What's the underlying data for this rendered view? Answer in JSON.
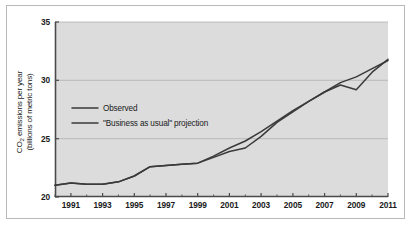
{
  "figure": {
    "frame_color": "#b9b9b9",
    "plot_bg_color": "#dcdcdc",
    "line_color": "#3a3a3a",
    "grid_color": "#b0b0b0",
    "axis_color": "#4a4a4a"
  },
  "axis": {
    "ylabel_line1_pre": "CO",
    "ylabel_line1_sub": "2",
    "ylabel_line1_post": " emissions per year",
    "ylabel_line2": "(billions of metric tons)",
    "yticks": [
      "20",
      "25",
      "30",
      "35"
    ],
    "xticks": [
      "1991",
      "1993",
      "1995",
      "1997",
      "1999",
      "2001",
      "2003",
      "2005",
      "2007",
      "2009",
      "2011"
    ]
  },
  "legend": {
    "items": [
      {
        "label": "Observed",
        "color": "#3a3a3a"
      },
      {
        "label": "\"Business as usual\" projection",
        "color": "#3a3a3a"
      }
    ]
  },
  "chart_data": {
    "type": "line",
    "title": "",
    "xlabel": "",
    "ylabel": "CO2 emissions per year (billions of metric tons)",
    "xlim": [
      1990,
      2011
    ],
    "ylim": [
      20,
      35
    ],
    "yticks": [
      20,
      25,
      30,
      35
    ],
    "xticks": [
      1991,
      1993,
      1995,
      1997,
      1999,
      2001,
      2003,
      2005,
      2007,
      2009,
      2011
    ],
    "minor_xticks_every": 1,
    "grid": "horizontal",
    "legend_position": "inside-upper-left",
    "x": [
      1990,
      1991,
      1992,
      1993,
      1994,
      1995,
      1996,
      1997,
      1998,
      1999,
      2000,
      2001,
      2002,
      2003,
      2004,
      2005,
      2006,
      2007,
      2008,
      2009,
      2010,
      2011
    ],
    "series": [
      {
        "name": "Observed",
        "values": [
          21.0,
          21.2,
          21.1,
          21.1,
          21.3,
          21.8,
          22.6,
          22.7,
          22.8,
          22.9,
          23.4,
          23.9,
          24.2,
          25.2,
          26.4,
          27.3,
          28.2,
          29.0,
          29.6,
          29.2,
          30.7,
          31.8
        ]
      },
      {
        "name": "\"Business as usual\" projection",
        "values": [
          21.0,
          21.2,
          21.1,
          21.1,
          21.3,
          21.8,
          22.6,
          22.7,
          22.8,
          22.9,
          23.5,
          24.2,
          24.8,
          25.6,
          26.5,
          27.4,
          28.2,
          29.0,
          29.8,
          30.3,
          31.0,
          31.7
        ]
      }
    ],
    "annotations": [
      {
        "text": "2009 dip below projection",
        "x": 2009,
        "y": 29.2
      }
    ]
  }
}
